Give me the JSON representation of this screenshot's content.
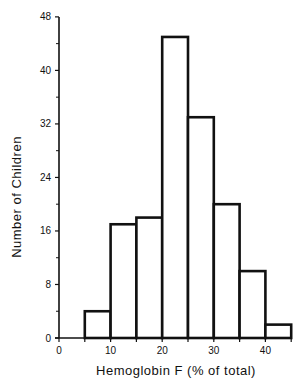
{
  "chart_data": {
    "type": "bar",
    "subtype": "histogram",
    "title": "",
    "xlabel": "Hemoglobin F (% of total)",
    "ylabel": "Number of Children",
    "xlim": [
      0,
      45
    ],
    "ylim": [
      0,
      48
    ],
    "xticks": [
      0,
      10,
      20,
      30,
      40
    ],
    "xminor_ticks": [
      5,
      15,
      25,
      35,
      45
    ],
    "yticks": [
      0,
      8,
      16,
      24,
      32,
      40,
      48
    ],
    "yminor_ticks": [
      4,
      12,
      20,
      28,
      36,
      44
    ],
    "grid": false,
    "legend": null,
    "bin_width": 5,
    "bins": [
      {
        "start": 5,
        "end": 10,
        "count": 4
      },
      {
        "start": 10,
        "end": 15,
        "count": 17
      },
      {
        "start": 15,
        "end": 20,
        "count": 18
      },
      {
        "start": 20,
        "end": 25,
        "count": 45
      },
      {
        "start": 25,
        "end": 30,
        "count": 33
      },
      {
        "start": 30,
        "end": 35,
        "count": 20
      },
      {
        "start": 35,
        "end": 40,
        "count": 10
      },
      {
        "start": 40,
        "end": 45,
        "count": 2
      }
    ],
    "categories": [
      "5-10",
      "10-15",
      "15-20",
      "20-25",
      "25-30",
      "30-35",
      "35-40",
      "40-45"
    ],
    "values": [
      4,
      17,
      18,
      45,
      33,
      20,
      10,
      2
    ],
    "colors": {
      "bar_fill": "#ffffff",
      "bar_stroke": "#111111",
      "axis": "#111111"
    }
  }
}
